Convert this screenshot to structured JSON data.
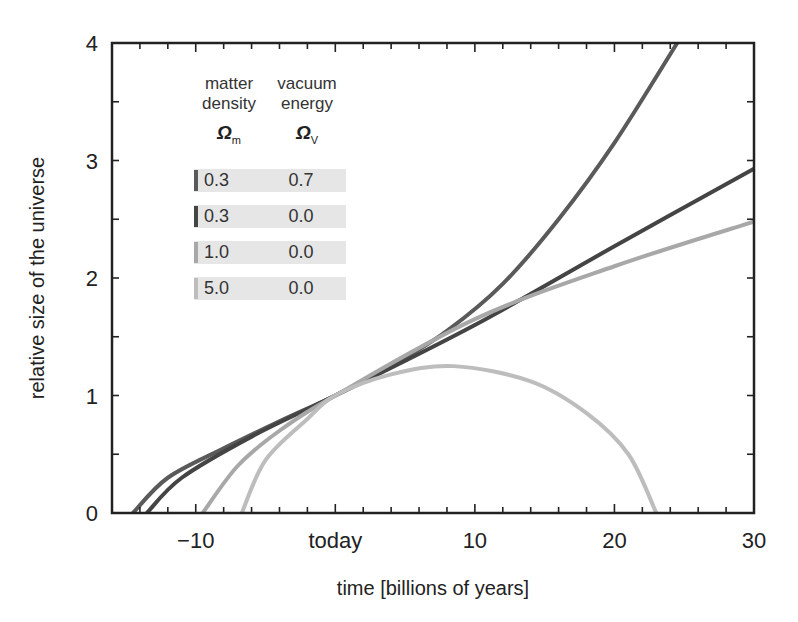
{
  "chart_data": {
    "type": "line",
    "title": "",
    "xlabel": "time [billions of years]",
    "ylabel": "relative size of the universe",
    "xlim": [
      -16,
      30
    ],
    "ylim": [
      0,
      4
    ],
    "x_ticks": [
      {
        "value": -10,
        "label": "−10"
      },
      {
        "value": 0,
        "label": "today"
      },
      {
        "value": 10,
        "label": "10"
      },
      {
        "value": 20,
        "label": "20"
      },
      {
        "value": 30,
        "label": "30"
      }
    ],
    "y_ticks": [
      {
        "value": 0,
        "label": "0"
      },
      {
        "value": 1,
        "label": "1"
      },
      {
        "value": 2,
        "label": "2"
      },
      {
        "value": 3,
        "label": "3"
      },
      {
        "value": 4,
        "label": "4"
      }
    ],
    "grid": false,
    "legend_position": "upper-left",
    "legend_headers": {
      "matter": "matter density",
      "matter_line1": "matter",
      "matter_line2": "density",
      "vacuum_line1": "vacuum",
      "vacuum_line2": "energy",
      "matter_symbol": "Ω",
      "matter_sub": "m",
      "vacuum_symbol": "Ω",
      "vacuum_sub": "V"
    },
    "series": [
      {
        "name": "Ωm=0.3, ΩV=0.7",
        "omega_m": "0.3",
        "omega_v": "0.7",
        "color": "#5a5a5a",
        "x": [
          -14.5,
          -12,
          -8,
          -4,
          0,
          4,
          8,
          12,
          16,
          20,
          24.5
        ],
        "y": [
          0,
          0.3,
          0.55,
          0.78,
          1,
          1.25,
          1.55,
          1.95,
          2.5,
          3.15,
          4
        ]
      },
      {
        "name": "Ωm=0.3, ΩV=0.0",
        "omega_m": "0.3",
        "omega_v": "0.0",
        "color": "#444444",
        "x": [
          -13.5,
          -11,
          -6,
          0,
          10,
          20,
          30
        ],
        "y": [
          0,
          0.3,
          0.65,
          1,
          1.6,
          2.27,
          2.93
        ]
      },
      {
        "name": "Ωm=1.0, ΩV=0.0",
        "omega_m": "1.0",
        "omega_v": "0.0",
        "color": "#a8a8a8",
        "x": [
          -9.5,
          -7,
          -4,
          0,
          10,
          20,
          30
        ],
        "y": [
          0,
          0.4,
          0.7,
          1,
          1.65,
          2.1,
          2.48
        ]
      },
      {
        "name": "Ωm=5.0, ΩV=0.0",
        "omega_m": "5.0",
        "omega_v": "0.0",
        "color": "#bdbdbd",
        "x": [
          -6.7,
          -5,
          -2,
          0,
          4,
          8.5,
          14,
          18,
          21,
          23
        ],
        "y": [
          0,
          0.45,
          0.8,
          1,
          1.18,
          1.25,
          1.12,
          0.85,
          0.5,
          0
        ]
      }
    ]
  }
}
